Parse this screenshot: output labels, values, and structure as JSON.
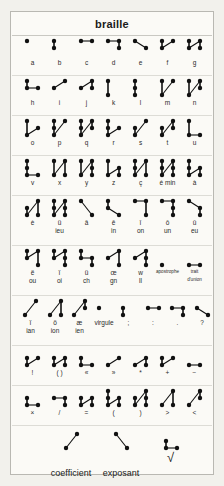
{
  "header": {
    "title": "braille"
  },
  "colors": {
    "ink": "#111111",
    "paper": "#fbfaf6",
    "border": "#b9b8b2",
    "rule": "#dddcd6",
    "outer": "#f2f1ec"
  },
  "chart_data": {
    "type": "table",
    "title": "braille",
    "rows": [
      {
        "cells": [
          {
            "label": "a",
            "label2": "",
            "dots": [
              1
            ]
          },
          {
            "label": "b",
            "label2": "",
            "dots": [
              1,
              2
            ]
          },
          {
            "label": "c",
            "label2": "",
            "dots": [
              1,
              4
            ]
          },
          {
            "label": "d",
            "label2": "",
            "dots": [
              1,
              4,
              5
            ]
          },
          {
            "label": "e",
            "label2": "",
            "dots": [
              1,
              5
            ]
          },
          {
            "label": "f",
            "label2": "",
            "dots": [
              1,
              2,
              4
            ]
          },
          {
            "label": "g",
            "label2": "",
            "dots": [
              1,
              2,
              4,
              5
            ]
          }
        ]
      },
      {
        "cells": [
          {
            "label": "h",
            "label2": "",
            "dots": [
              1,
              2,
              5
            ]
          },
          {
            "label": "i",
            "label2": "",
            "dots": [
              2,
              4
            ]
          },
          {
            "label": "j",
            "label2": "",
            "dots": [
              2,
              4,
              5
            ]
          },
          {
            "label": "k",
            "label2": "",
            "dots": [
              1,
              3
            ]
          },
          {
            "label": "l",
            "label2": "",
            "dots": [
              1,
              2,
              3
            ]
          },
          {
            "label": "m",
            "label2": "",
            "dots": [
              1,
              3,
              4
            ]
          },
          {
            "label": "n",
            "label2": "",
            "dots": [
              1,
              3,
              4,
              5
            ]
          }
        ]
      },
      {
        "cells": [
          {
            "label": "o",
            "label2": "",
            "dots": [
              1,
              3,
              5
            ]
          },
          {
            "label": "p",
            "label2": "",
            "dots": [
              1,
              2,
              3,
              4
            ]
          },
          {
            "label": "q",
            "label2": "",
            "dots": [
              1,
              2,
              3,
              4,
              5
            ]
          },
          {
            "label": "r",
            "label2": "",
            "dots": [
              1,
              2,
              3,
              5
            ]
          },
          {
            "label": "s",
            "label2": "",
            "dots": [
              2,
              3,
              4
            ]
          },
          {
            "label": "t",
            "label2": "",
            "dots": [
              2,
              3,
              4,
              5
            ]
          },
          {
            "label": "u",
            "label2": "",
            "dots": [
              1,
              3,
              6
            ]
          }
        ]
      },
      {
        "cells": [
          {
            "label": "v",
            "label2": "",
            "dots": [
              1,
              2,
              3,
              6
            ]
          },
          {
            "label": "x",
            "label2": "",
            "dots": [
              1,
              3,
              4,
              6
            ]
          },
          {
            "label": "y",
            "label2": "",
            "dots": [
              1,
              3,
              4,
              5,
              6
            ]
          },
          {
            "label": "z",
            "label2": "",
            "dots": [
              1,
              3,
              5,
              6
            ]
          },
          {
            "label": "ç",
            "label2": "",
            "dots": [
              1,
              2,
              3,
              4,
              6
            ]
          },
          {
            "label": "é min",
            "label2": "",
            "dots": [
              1,
              2,
              3,
              4,
              5,
              6
            ]
          },
          {
            "label": "à",
            "label2": "",
            "dots": [
              1,
              2,
              3,
              5,
              6
            ]
          }
        ]
      },
      {
        "cells": [
          {
            "label": "è",
            "label2": "",
            "dots": [
              2,
              3,
              4,
              6
            ]
          },
          {
            "label": "ü",
            "label2": "ieu",
            "dots": [
              1,
              2,
              3,
              4,
              5,
              6
            ]
          },
          {
            "label": "â",
            "label2": "",
            "dots": [
              1,
              6
            ]
          },
          {
            "label": "ê",
            "label2": "in",
            "dots": [
              1,
              2,
              6
            ]
          },
          {
            "label": "î",
            "label2": "on",
            "dots": [
              1,
              4,
              6
            ]
          },
          {
            "label": "ô",
            "label2": "un",
            "dots": [
              1,
              4,
              5,
              6
            ]
          },
          {
            "label": "û",
            "label2": "eu",
            "dots": [
              1,
              5,
              6
            ]
          }
        ]
      },
      {
        "cells": [
          {
            "label": "ë",
            "label2": "ou",
            "dots": [
              1,
              2,
              4,
              6
            ]
          },
          {
            "label": "ï",
            "label2": "oi",
            "dots": [
              1,
              2,
              4,
              5,
              6
            ]
          },
          {
            "label": "ü",
            "label2": "ch",
            "dots": [
              1,
              2,
              5,
              6
            ]
          },
          {
            "label": "œ",
            "label2": "gn",
            "dots": [
              2,
              4,
              6
            ]
          },
          {
            "label": "w",
            "label2": "ll",
            "dots": [
              2,
              4,
              5,
              6
            ]
          },
          {
            "label": "apostrophe",
            "label2": "",
            "dots": [
              3
            ],
            "tiny": true
          },
          {
            "label": "trait",
            "label2": "d'union",
            "dots": [
              3,
              6
            ],
            "tiny": true
          }
        ]
      },
      {
        "cells": [
          {
            "label": "ï",
            "label2": "ian",
            "dots": [
              3,
              4
            ]
          },
          {
            "label": "ö",
            "label2": "ion",
            "dots": [
              3,
              4,
              6
            ]
          },
          {
            "label": "æ",
            "label2": "ien",
            "dots": [
              3,
              4,
              5
            ]
          },
          {
            "label": "virgule",
            "label2": "",
            "dots": [
              2
            ]
          },
          {
            "label": ";",
            "label2": "",
            "dots": [
              2,
              3
            ]
          },
          {
            "label": ":",
            "label2": "",
            "dots": [
              2,
              5
            ]
          },
          {
            "label": ".",
            "label2": "",
            "dots": [
              2,
              5,
              6
            ]
          },
          {
            "label": "?",
            "label2": "",
            "dots": [
              2,
              6
            ]
          }
        ]
      },
      {
        "cells": [
          {
            "label": "!",
            "label2": "",
            "dots": [
              2,
              3,
              5
            ]
          },
          {
            "label": "( )",
            "label2": "",
            "dots": [
              2,
              3,
              5,
              6
            ]
          },
          {
            "label": "«",
            "label2": "",
            "dots": [
              2,
              3,
              6
            ]
          },
          {
            "label": "»",
            "label2": "",
            "dots": [
              3,
              5
            ]
          },
          {
            "label": "*",
            "label2": "",
            "dots": [
              3,
              5,
              6
            ]
          },
          {
            "label": "+",
            "label2": "",
            "dots": [
              2,
              3,
              5
            ]
          },
          {
            "label": "−",
            "label2": "",
            "dots": [
              3,
              6
            ]
          }
        ]
      },
      {
        "cells": [
          {
            "label": "×",
            "label2": "",
            "dots": [
              2,
              3,
              6
            ]
          },
          {
            "label": "/",
            "label2": "",
            "dots": [
              2,
              5,
              6
            ]
          },
          {
            "label": "=",
            "label2": "",
            "dots": [
              2,
              3,
              5,
              6
            ]
          },
          {
            "label": "(",
            "label2": "",
            "dots": [
              1,
              2,
              3,
              5,
              6
            ]
          },
          {
            "label": ")",
            "label2": "",
            "dots": [
              2,
              3,
              4,
              5,
              6
            ]
          },
          {
            "label": ">",
            "label2": "",
            "dots": [
              3,
              4,
              6
            ]
          },
          {
            "label": "<",
            "label2": "",
            "dots": [
              3,
              4,
              5
            ]
          }
        ]
      }
    ],
    "footer": {
      "items": [
        {
          "label": "coefficient",
          "dots": [
            3,
            4
          ]
        },
        {
          "label": "exposant",
          "dots": [
            1,
            6
          ]
        },
        {
          "label": "",
          "dots": [
            2,
            3,
            6
          ],
          "radical": "√"
        }
      ]
    }
  }
}
